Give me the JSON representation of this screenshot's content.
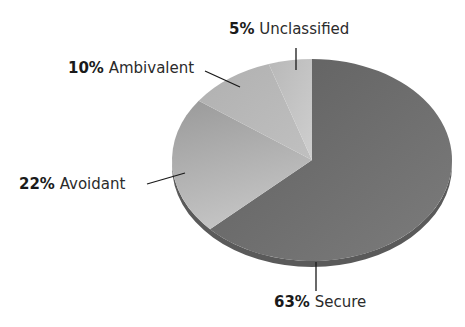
{
  "chart_data": {
    "type": "pie",
    "title": "",
    "categories": [
      "Secure",
      "Avoidant",
      "Ambivalent",
      "Unclassified"
    ],
    "values": [
      63,
      22,
      10,
      5
    ],
    "unit": "%",
    "labels": [
      {
        "pct": "63%",
        "name": "Secure"
      },
      {
        "pct": "22%",
        "name": "Avoidant"
      },
      {
        "pct": "10%",
        "name": "Ambivalent"
      },
      {
        "pct": "5%",
        "name": "Unclassified"
      }
    ],
    "colors": [
      "#6e6e6e",
      "#a8a8a8",
      "#b8b8b8",
      "#c6c6c6"
    ],
    "style": "3d-tilted-pie",
    "legend": "none (callout labels)"
  }
}
